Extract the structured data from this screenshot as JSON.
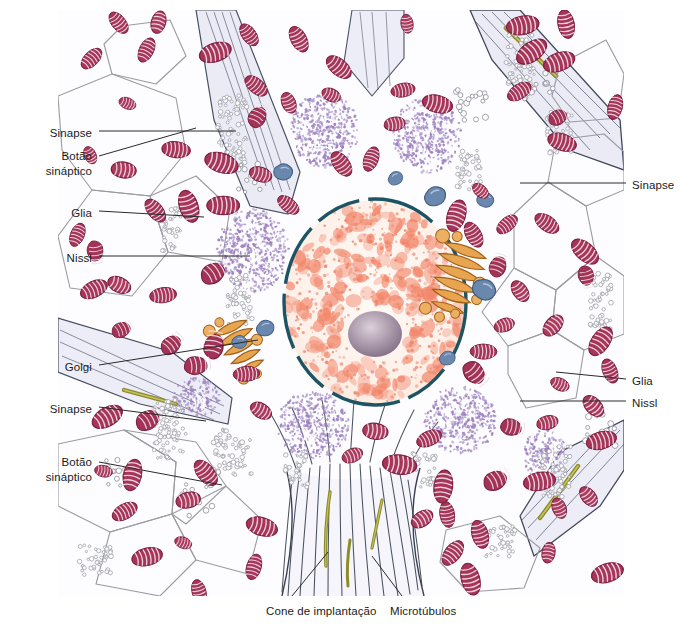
{
  "figure": {
    "kind": "neuron-histology-illustration",
    "language": "pt-BR",
    "width": 692,
    "height": 641,
    "background": "#ffffff"
  },
  "palette": {
    "background": "#ffffff",
    "cytoplasm": "#fdfdff",
    "process_fill": "#e9e9f5",
    "process_outline": "#3c4354",
    "glia_outline": "#8d8d96",
    "mitochondria_fill": "#9f2f55",
    "mitochondria_dark": "#7d1f42",
    "mitochondria_light": "#c0718f",
    "nissl_stipple": "#9b7fbe",
    "nucleus_envelope": "#1d5463",
    "chromatin": "#f2866a",
    "chromatin_light": "#fde8de",
    "nucleolus": "#8d7a90",
    "nucleolus_light": "#cdbcc9",
    "golgi": "#e0953f",
    "golgi_dark": "#b06a1f",
    "lysosome": "#5d7da6",
    "synaptic_bar": "#8e8c2a",
    "microtubule": "#3b4150",
    "label_text": "#1b1b1b",
    "leader_line": "#2a2a2a"
  },
  "labels": {
    "left": [
      {
        "id": "sinapse-top",
        "text": "Sinapse",
        "lines": [
          "Sinapse"
        ],
        "x": 92,
        "y": 126,
        "align": "right"
      },
      {
        "id": "botao-sinaptico-top",
        "text": "Botão sináptico",
        "lines": [
          "Botão",
          "sináptico"
        ],
        "x": 92,
        "y": 149,
        "align": "right"
      },
      {
        "id": "glia-left",
        "text": "Glia",
        "lines": [
          "Glia"
        ],
        "x": 92,
        "y": 206,
        "align": "right"
      },
      {
        "id": "nissl-left",
        "text": "Nissl",
        "lines": [
          "Nissl"
        ],
        "x": 92,
        "y": 251,
        "align": "right"
      },
      {
        "id": "golgi-left",
        "text": "Golgi",
        "lines": [
          "Golgi"
        ],
        "x": 92,
        "y": 360,
        "align": "right"
      },
      {
        "id": "sinapse-left-low",
        "text": "Sinapse",
        "lines": [
          "Sinapse"
        ],
        "x": 92,
        "y": 402,
        "align": "right"
      },
      {
        "id": "botao-sinaptico-low",
        "text": "Botão sináptico",
        "lines": [
          "Botão",
          "sináptico"
        ],
        "x": 92,
        "y": 455,
        "align": "right"
      }
    ],
    "right": [
      {
        "id": "sinapse-right",
        "text": "Sinapse",
        "lines": [
          "Sinapse"
        ],
        "x": 632,
        "y": 178,
        "align": "left"
      },
      {
        "id": "glia-right",
        "text": "Glia",
        "lines": [
          "Glia"
        ],
        "x": 632,
        "y": 374,
        "align": "left"
      },
      {
        "id": "nissl-right",
        "text": "Nissl",
        "lines": [
          "Nissl"
        ],
        "x": 632,
        "y": 396,
        "align": "left"
      }
    ],
    "bottom": [
      {
        "id": "cone-de-implantacao",
        "text": "Cone de implantação",
        "lines": [
          "Cone de implantação"
        ],
        "x": 266,
        "y": 604,
        "align": "left"
      },
      {
        "id": "microtubulos",
        "text": "Microtúbulos",
        "lines": [
          "Microtúbulos"
        ],
        "x": 390,
        "y": 604,
        "align": "left"
      }
    ]
  },
  "leaders": [
    {
      "id": "leader-sinapse-top",
      "from": [
        99,
        131
      ],
      "to": [
        236,
        131
      ]
    },
    {
      "id": "leader-botao-sinaptico-top",
      "from": [
        99,
        156
      ],
      "to": [
        196,
        128
      ]
    },
    {
      "id": "leader-glia-left",
      "from": [
        99,
        211
      ],
      "to": [
        204,
        217
      ]
    },
    {
      "id": "leader-nissl-left",
      "from": [
        99,
        256
      ],
      "to": [
        250,
        256
      ]
    },
    {
      "id": "leader-golgi-left",
      "from": [
        99,
        365
      ],
      "to": [
        258,
        340
      ]
    },
    {
      "id": "leader-sinapse-left-low",
      "from": [
        99,
        407
      ],
      "to": [
        206,
        421
      ]
    },
    {
      "id": "leader-botao-low",
      "from": [
        99,
        462
      ],
      "to": [
        222,
        485
      ]
    },
    {
      "id": "leader-sinapse-right",
      "from": [
        626,
        183
      ],
      "to": [
        520,
        183
      ]
    },
    {
      "id": "leader-glia-right",
      "from": [
        626,
        379
      ],
      "to": [
        556,
        372
      ]
    },
    {
      "id": "leader-nissl-right",
      "from": [
        626,
        401
      ],
      "to": [
        520,
        401
      ]
    },
    {
      "id": "leader-cone",
      "from": [
        292,
        596
      ],
      "to": [
        328,
        552
      ]
    },
    {
      "id": "leader-micro",
      "from": [
        402,
        596
      ],
      "to": [
        372,
        556
      ]
    }
  ],
  "structures": {
    "nucleus": {
      "name": "nucleus",
      "center": [
        375,
        302
      ],
      "rx": 92,
      "ry": 104,
      "envelope_dashed": true,
      "nucleolus": {
        "center": [
          375,
          334
        ],
        "rx": 27,
        "ry": 23
      }
    },
    "golgi_bodies": [
      {
        "id": "golgi-right",
        "center": [
          455,
          282
        ]
      },
      {
        "id": "golgi-left",
        "center": [
          242,
          350
        ]
      }
    ],
    "nissl_bodies": [
      {
        "id": "nissl-1",
        "center": [
          253,
          250
        ],
        "rx": 36,
        "ry": 42
      },
      {
        "id": "nissl-2",
        "center": [
          325,
          130
        ],
        "rx": 34,
        "ry": 38
      },
      {
        "id": "nissl-3",
        "center": [
          427,
          135
        ],
        "rx": 34,
        "ry": 38
      },
      {
        "id": "nissl-4",
        "center": [
          313,
          425
        ],
        "rx": 36,
        "ry": 34
      },
      {
        "id": "nissl-5",
        "center": [
          460,
          420
        ],
        "rx": 36,
        "ry": 34
      },
      {
        "id": "nissl-6",
        "center": [
          196,
          398
        ],
        "rx": 24,
        "ry": 20
      },
      {
        "id": "nissl-7",
        "center": [
          545,
          455
        ],
        "rx": 22,
        "ry": 26
      }
    ],
    "axon_hillock": {
      "name": "cone de implantação",
      "center": [
        350,
        540
      ]
    }
  },
  "counts": {
    "mitochondria": 96,
    "nissl_bodies": 7,
    "golgi_bodies": 2,
    "lysosomes": 8
  }
}
